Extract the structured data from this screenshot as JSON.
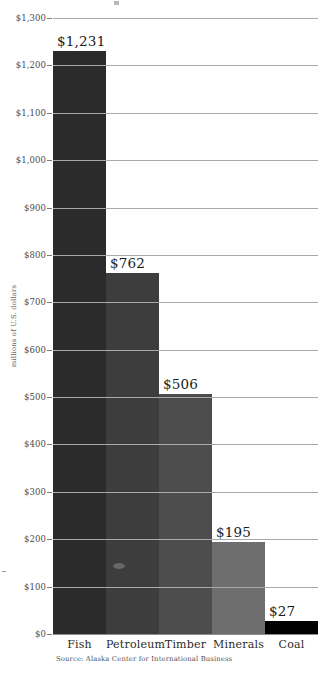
{
  "chart_data": {
    "type": "bar",
    "title": "",
    "xlabel": "",
    "ylabel": "millions of U.S. dollars",
    "categories": [
      "Fish",
      "Petroleum",
      "Timber",
      "Minerals",
      "Coal"
    ],
    "values": [
      1231,
      762,
      506,
      195,
      27
    ],
    "value_labels": [
      "$1,231",
      "$762",
      "$506",
      "$195",
      "$27"
    ],
    "ylim": [
      0,
      1300
    ],
    "ytick_values": [
      0,
      100,
      200,
      300,
      400,
      500,
      600,
      700,
      800,
      900,
      1000,
      1100,
      1200,
      1300
    ],
    "ytick_labels": [
      "$0",
      "$100",
      "$200",
      "$300",
      "$400",
      "$500",
      "$600",
      "$700",
      "$800",
      "$900",
      "$1,000",
      "$1,100",
      "$1,200",
      "$1,300"
    ],
    "grid": true,
    "legend": false,
    "bar_colors": [
      "#2b2b2b",
      "#3d3d3d",
      "#4d4d4d",
      "#6e6e6e",
      "#000000"
    ],
    "gridline_color": "#a9a9a9",
    "background": "#ffffff"
  },
  "source": {
    "text": "Source: Alaska Center for International Business"
  }
}
